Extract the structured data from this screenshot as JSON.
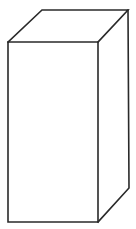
{
  "diagram": {
    "type": "cuboid-line-drawing",
    "shape": "rectangular-prism",
    "colors": {
      "background": "#ffffff",
      "stroke": "#2a2a2a",
      "face_fill": "#ffffff"
    },
    "vertices": {
      "front_top_left": [
        8,
        42
      ],
      "front_top_right": [
        98,
        42
      ],
      "front_bottom_left": [
        8,
        222
      ],
      "front_bottom_right": [
        98,
        222
      ],
      "back_top_left": [
        42,
        10
      ],
      "back_top_right": [
        128,
        10
      ],
      "back_bottom_right": [
        129,
        188
      ]
    },
    "faces": [
      "front",
      "top",
      "right-side"
    ],
    "hidden_edges_shown": false
  }
}
